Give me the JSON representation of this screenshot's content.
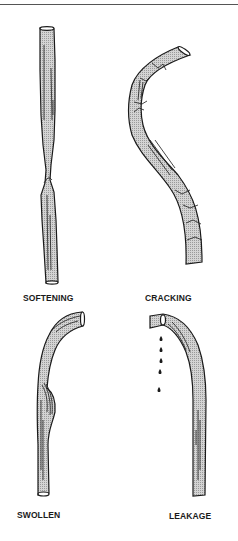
{
  "figure": {
    "type": "technical-illustration",
    "colors": {
      "outline": "#1a1a1a",
      "fill_stipple": "#bdbdbd",
      "background": "#ffffff",
      "rule": "#555555"
    },
    "panels": [
      {
        "id": "softening",
        "label": "SOFTENING",
        "depiction": "straight hose pinched/narrowed in the middle"
      },
      {
        "id": "cracking",
        "label": "CRACKING",
        "depiction": "S-curved hose with surface cracks"
      },
      {
        "id": "swollen",
        "label": "SWOLLEN",
        "depiction": "hooked hose with bulge on the side"
      },
      {
        "id": "leakage",
        "label": "LEAKAGE",
        "depiction": "hooked hose with fluid drops falling from the end"
      }
    ],
    "leak_drops": 5
  }
}
